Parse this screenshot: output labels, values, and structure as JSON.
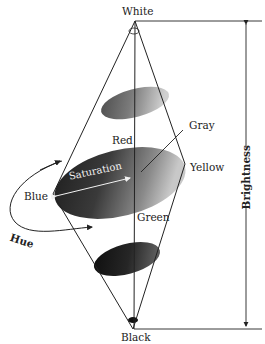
{
  "figure": {
    "labels": {
      "top": "White",
      "bottom": "Black",
      "red": "Red",
      "gray": "Gray",
      "yellow": "Yellow",
      "blue": "Blue",
      "green": "Green",
      "saturation": "Saturation",
      "hue": "Hue",
      "brightness": "Brightness"
    },
    "colors": {
      "line": "#222222",
      "ellipse_dark": "#1a1a1a",
      "ellipse_mid": "#555555",
      "ellipse_light": "#b5b5b5",
      "background": "#ffffff"
    }
  }
}
